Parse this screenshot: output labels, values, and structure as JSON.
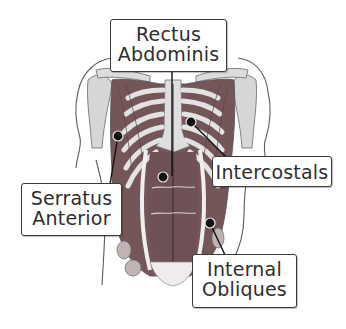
{
  "diagram": {
    "colors": {
      "muscle": "#745659",
      "muscle_dark": "#5e4547",
      "bone": "#d9d9d9",
      "outline": "#555555",
      "label_border": "#3a3a3a",
      "text": "#2e2e2e",
      "pointer": "#111111"
    },
    "labels": [
      {
        "id": "rectus-abdominis",
        "line1": "Rectus",
        "line2": "Abdominis"
      },
      {
        "id": "intercostals",
        "line1": "Intercostals"
      },
      {
        "id": "serratus-anterior",
        "line1": "Serratus",
        "line2": "Anterior"
      },
      {
        "id": "internal-obliques",
        "line1": "Internal",
        "line2": "Obliques"
      }
    ]
  }
}
